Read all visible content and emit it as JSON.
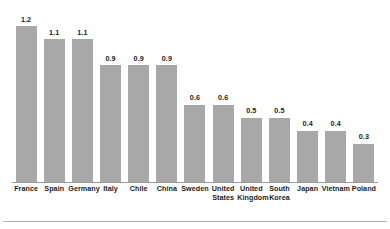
{
  "chart_data": {
    "type": "bar",
    "title": "",
    "subtitle": "",
    "xlabel": "",
    "ylabel": "",
    "ylim": [
      0,
      1.2
    ],
    "grid": false,
    "legend": "none",
    "orientation": "vertical",
    "value_labels_shown": true,
    "bar_color": "#a8a8a8",
    "axis_color": "#9a9a9a",
    "label_color": "#1c1c1c",
    "background_color": "#ffffff",
    "categories": [
      "France",
      "Spain",
      "Germany",
      "Italy",
      "Chile",
      "China",
      "Sweden",
      "United States",
      "United Kingdom",
      "South Korea",
      "Japan",
      "Vietnam",
      "Poland"
    ],
    "values": [
      1.2,
      1.1,
      1.1,
      0.9,
      0.9,
      0.9,
      0.6,
      0.6,
      0.5,
      0.5,
      0.4,
      0.4,
      0.3
    ],
    "value_labels": [
      "1.2",
      "1.1",
      "1.1",
      "0.9",
      "0.9",
      "0.9",
      "0.6",
      "0.6",
      "0.5",
      "0.5",
      "0.4",
      "0.4",
      "0.3"
    ],
    "bars": [
      {
        "category": "France",
        "label_lines": [
          "France"
        ],
        "value": 1.2,
        "value_label": "1.2"
      },
      {
        "category": "Spain",
        "label_lines": [
          "Spain"
        ],
        "value": 1.1,
        "value_label": "1.1"
      },
      {
        "category": "Germany",
        "label_lines": [
          "Germany"
        ],
        "value": 1.1,
        "value_label": "1.1"
      },
      {
        "category": "Italy",
        "label_lines": [
          "Italy"
        ],
        "value": 0.9,
        "value_label": "0.9"
      },
      {
        "category": "Chile",
        "label_lines": [
          "Chile"
        ],
        "value": 0.9,
        "value_label": "0.9"
      },
      {
        "category": "China",
        "label_lines": [
          "China"
        ],
        "value": 0.9,
        "value_label": "0.9"
      },
      {
        "category": "Sweden",
        "label_lines": [
          "Sweden"
        ],
        "value": 0.6,
        "value_label": "0.6"
      },
      {
        "category": "United States",
        "label_lines": [
          "United",
          "States"
        ],
        "value": 0.6,
        "value_label": "0.6"
      },
      {
        "category": "United Kingdom",
        "label_lines": [
          "United",
          "Kingdom"
        ],
        "value": 0.5,
        "value_label": "0.5"
      },
      {
        "category": "South Korea",
        "label_lines": [
          "South",
          "Korea"
        ],
        "value": 0.5,
        "value_label": "0.5"
      },
      {
        "category": "Japan",
        "label_lines": [
          "Japan"
        ],
        "value": 0.4,
        "value_label": "0.4"
      },
      {
        "category": "Vietnam",
        "label_lines": [
          "Vietnam"
        ],
        "value": 0.4,
        "value_label": "0.4"
      },
      {
        "category": "Poland",
        "label_lines": [
          "Poland"
        ],
        "value": 0.3,
        "value_label": "0.3"
      }
    ]
  }
}
